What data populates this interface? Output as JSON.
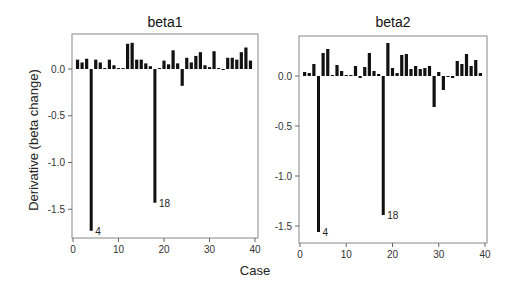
{
  "chart_data": [
    {
      "type": "bar",
      "title": "beta1",
      "xlabel": "Case",
      "ylabel": "Derivative (beta change)",
      "xlim": [
        0,
        40
      ],
      "ylim": [
        -1.8,
        0.35
      ],
      "xticks": [
        0,
        10,
        20,
        30,
        40
      ],
      "yticks": [
        0.0,
        -0.5,
        -1.0,
        -1.5
      ],
      "ytick_labels": [
        "0.0",
        "-0.5",
        "-1.0",
        "-1.5"
      ],
      "grid": false,
      "x": [
        1,
        2,
        3,
        4,
        5,
        6,
        7,
        8,
        9,
        10,
        11,
        12,
        13,
        14,
        15,
        16,
        17,
        18,
        19,
        20,
        21,
        22,
        23,
        24,
        25,
        26,
        27,
        28,
        29,
        30,
        31,
        32,
        33,
        34,
        35,
        36,
        37,
        38,
        39
      ],
      "values": [
        0.1,
        0.07,
        0.11,
        -1.73,
        0.1,
        0.07,
        0.01,
        0.1,
        0.04,
        0.01,
        0.01,
        0.27,
        0.28,
        0.1,
        0.1,
        0.06,
        0.03,
        -1.43,
        0.01,
        0.09,
        0.05,
        0.2,
        0.06,
        -0.18,
        0.12,
        0.07,
        0.14,
        0.18,
        0.04,
        0.02,
        0.19,
        0.01,
        0.0,
        0.12,
        0.12,
        0.1,
        0.18,
        0.23,
        0.09
      ],
      "annotations": [
        {
          "case": 4,
          "label": "4"
        },
        {
          "case": 18,
          "label": "18"
        }
      ]
    },
    {
      "type": "bar",
      "title": "beta2",
      "xlabel": "Case",
      "ylabel": "Derivative (beta change)",
      "xlim": [
        0,
        40
      ],
      "ylim": [
        -1.65,
        0.4
      ],
      "xticks": [
        0,
        10,
        20,
        30,
        40
      ],
      "yticks": [
        0.0,
        -0.5,
        -1.0,
        -1.5
      ],
      "ytick_labels": [
        "0.0",
        "-0.5",
        "-1.0",
        "-1.5"
      ],
      "grid": false,
      "x": [
        1,
        2,
        3,
        4,
        5,
        6,
        7,
        8,
        9,
        10,
        11,
        12,
        13,
        14,
        15,
        16,
        17,
        18,
        19,
        20,
        21,
        22,
        23,
        24,
        25,
        26,
        27,
        28,
        29,
        30,
        31,
        32,
        33,
        34,
        35,
        36,
        37,
        38,
        39
      ],
      "values": [
        0.04,
        0.03,
        0.12,
        -1.56,
        0.23,
        0.27,
        0.01,
        0.11,
        0.05,
        0.01,
        0.01,
        0.1,
        -0.02,
        0.09,
        0.23,
        0.05,
        0.02,
        -1.39,
        0.33,
        0.08,
        0.03,
        0.21,
        0.22,
        0.07,
        0.1,
        0.07,
        0.08,
        0.1,
        -0.31,
        0.04,
        -0.14,
        0.0,
        -0.02,
        0.15,
        0.12,
        0.22,
        0.1,
        0.16,
        0.03
      ],
      "annotations": [
        {
          "case": 4,
          "label": "4"
        },
        {
          "case": 18,
          "label": "18"
        }
      ]
    }
  ],
  "figure": {
    "shared_xlabel": "Case",
    "shared_ylabel": "Derivative (beta change)",
    "bar_color": "#111111",
    "frame_color": "#888888"
  }
}
